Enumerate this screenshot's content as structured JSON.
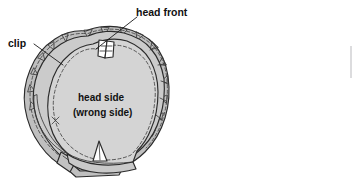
{
  "figure": {
    "background_color": "#ffffff",
    "line_color": "#2b2b2b",
    "fill_main": "#d2d2d2",
    "fill_band": "#c2c2c2",
    "fill_band_dark": "#b0b0b0",
    "fill_highlight": "#ffffff",
    "labels": {
      "head_front": "head front",
      "clip": "clip",
      "head_side": "head side",
      "wrong_side": "(wrong side)"
    }
  }
}
